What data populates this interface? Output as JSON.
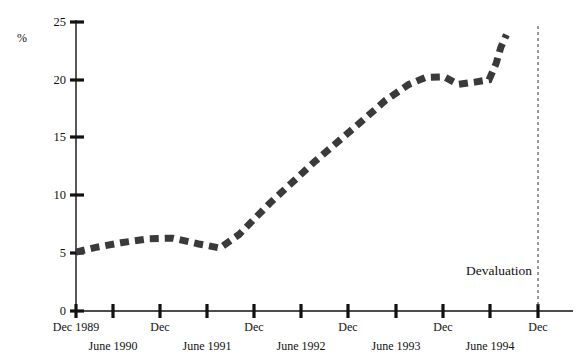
{
  "chart_data": {
    "type": "line",
    "title": "",
    "subtitle": "",
    "xlabel": "",
    "ylabel": "%",
    "ylim": [
      0,
      25
    ],
    "yticks": [
      0,
      5,
      10,
      15,
      20,
      25
    ],
    "ytick_labels": [
      "0",
      "5",
      "10",
      "15",
      "20",
      "25"
    ],
    "grid": false,
    "legend": "none",
    "xtick_labels_primary": [
      "Dec 1989",
      "Dec",
      "Dec",
      "Dec",
      "Dec",
      "Dec"
    ],
    "xtick_labels_secondary": [
      "June 1990",
      "June 1991",
      "June 1992",
      "June 1993",
      "June 1994"
    ],
    "x_categories": [
      "Dec 1989",
      "June 1990",
      "Dec 1990",
      "June 1991",
      "Dec 1991",
      "June 1992",
      "Dec 1992",
      "June 1993",
      "Dec 1993",
      "June 1994",
      "Dec 1994"
    ],
    "annotations": [
      {
        "label": "Devaluation",
        "at_category": "Dec 1994",
        "style": "vertical-dashed-line"
      }
    ],
    "series": [
      {
        "name": "rate",
        "values": [
          5.1,
          5.6,
          6.1,
          6.3,
          5.4,
          9.6,
          12.8,
          15.9,
          18.2,
          20.2,
          20.0
        ]
      }
    ],
    "points": [
      {
        "x": 0.0,
        "y": 5.1
      },
      {
        "x": 0.42,
        "y": 5.5
      },
      {
        "x": 0.95,
        "y": 5.9
      },
      {
        "x": 1.55,
        "y": 6.25
      },
      {
        "x": 2.05,
        "y": 6.3
      },
      {
        "x": 2.6,
        "y": 5.8
      },
      {
        "x": 3.05,
        "y": 5.45
      },
      {
        "x": 3.45,
        "y": 6.6
      },
      {
        "x": 4.1,
        "y": 9.3
      },
      {
        "x": 5.05,
        "y": 12.9
      },
      {
        "x": 6.05,
        "y": 16.4
      },
      {
        "x": 6.55,
        "y": 18.2
      },
      {
        "x": 7.05,
        "y": 19.6
      },
      {
        "x": 7.4,
        "y": 20.2
      },
      {
        "x": 7.8,
        "y": 20.25
      },
      {
        "x": 8.1,
        "y": 19.6
      },
      {
        "x": 8.45,
        "y": 19.8
      },
      {
        "x": 8.75,
        "y": 20.0
      },
      {
        "x": 8.9,
        "y": 21.4
      },
      {
        "x": 9.0,
        "y": 22.8
      },
      {
        "x": 9.12,
        "y": 23.9
      }
    ],
    "tail_spike": {
      "description": "sharp vertical rise just after the Devaluation line",
      "from": 20.0,
      "to": 23.9
    }
  },
  "axis": {
    "y_unit_label": "%"
  }
}
